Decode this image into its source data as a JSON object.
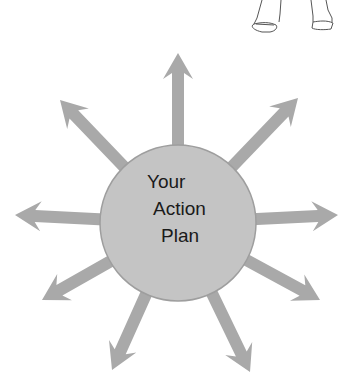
{
  "diagram": {
    "center_label_lines": [
      "Your",
      "Action",
      "Plan"
    ],
    "center": {
      "x": 178,
      "y": 223,
      "r": 78
    },
    "colors": {
      "arrow": "#a9a9a9",
      "circle_fill": "#c4c4c4",
      "circle_stroke": "#9e9e9e",
      "text": "#1a1a1a",
      "sketch": "#555555"
    },
    "arrows": [
      {
        "name": "up",
        "tip": [
          178,
          53
        ]
      },
      {
        "name": "upper-right",
        "tip": [
          298,
          98
        ]
      },
      {
        "name": "right",
        "tip": [
          338,
          215
        ]
      },
      {
        "name": "lower-right",
        "tip": [
          320,
          300
        ]
      },
      {
        "name": "bottom-right",
        "tip": [
          250,
          372
        ]
      },
      {
        "name": "bottom-left",
        "tip": [
          112,
          370
        ]
      },
      {
        "name": "lower-left",
        "tip": [
          42,
          300
        ]
      },
      {
        "name": "left",
        "tip": [
          15,
          215
        ]
      },
      {
        "name": "upper-left",
        "tip": [
          60,
          100
        ]
      }
    ],
    "sketch": "feet-of-person-illustration"
  }
}
